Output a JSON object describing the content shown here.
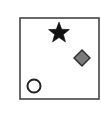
{
  "diagram": {
    "frame": {
      "x": 20,
      "y": 18,
      "width": 79,
      "height": 81,
      "stroke": "#444444",
      "stroke_width": 1.6,
      "fill": "#ffffff"
    },
    "shapes": [
      {
        "kind": "star",
        "name": "star-shape",
        "cx": 59,
        "cy": 33,
        "outer_r": 11,
        "inner_r": 4.6,
        "fill": "#111111",
        "stroke": "#111111"
      },
      {
        "kind": "diamond",
        "name": "diamond-shape",
        "cx": 82,
        "cy": 58,
        "half": 8,
        "fill": "#7a7a7a",
        "stroke": "#2a2a2a"
      },
      {
        "kind": "circle",
        "name": "circle-shape",
        "cx": 34,
        "cy": 86,
        "r": 6.5,
        "fill": "#ffffff",
        "stroke": "#222222",
        "stroke_width": 2
      }
    ]
  }
}
